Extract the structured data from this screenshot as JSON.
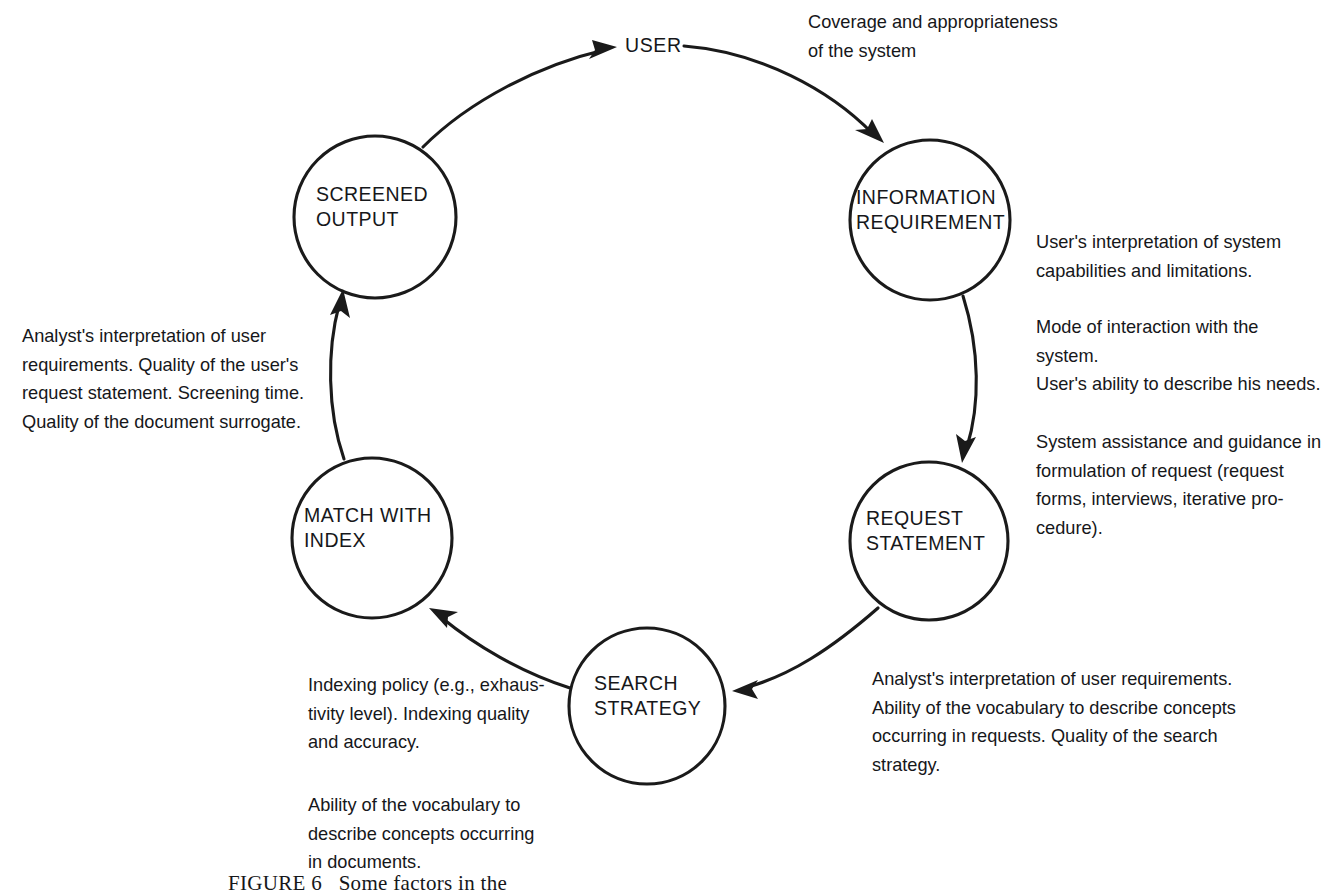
{
  "figure": {
    "caption": "FIGURE 6   Some factors in the"
  },
  "nodes": [
    {
      "id": "user",
      "label": "USER",
      "shape": "text"
    },
    {
      "id": "information",
      "label": "INFORMATION\nREQUIREMENT",
      "shape": "circle"
    },
    {
      "id": "request",
      "label": "REQUEST\nSTATEMENT",
      "shape": "circle"
    },
    {
      "id": "search",
      "label": "SEARCH\nSTRATEGY",
      "shape": "circle"
    },
    {
      "id": "match",
      "label": "MATCH WITH\nINDEX",
      "shape": "circle"
    },
    {
      "id": "screened",
      "label": "SCREENED\nOUTPUT",
      "shape": "circle"
    }
  ],
  "annotations": [
    {
      "id": "coverage",
      "text": "Coverage and appropriateness\nof the system"
    },
    {
      "id": "user-interpretation",
      "text": "User's interpretation of system\ncapabilities and limitations."
    },
    {
      "id": "mode-of-interaction",
      "text": "Mode of interaction with the\nsystem."
    },
    {
      "id": "user-ability",
      "text": "User's ability to describe his needs."
    },
    {
      "id": "system-assistance",
      "text": "System assistance and guidance in\nformulation of request (request\nforms, interviews, iterative pro-\ncedure)."
    },
    {
      "id": "analyst-interpretation-request",
      "text": "Analyst's interpretation of user requirements.\nAbility of the vocabulary to describe concepts\noccurring in requests. Quality of the search\nstrategy."
    },
    {
      "id": "indexing-policy",
      "text": "Indexing policy (e.g., exhaus-\ntivity level). Indexing quality\nand accuracy."
    },
    {
      "id": "vocabulary-documents",
      "text": "Ability of the vocabulary to\ndescribe concepts occurring\nin documents."
    },
    {
      "id": "analyst-interpretation-output",
      "text": "Analyst's interpretation of user\nrequirements. Quality of the user's\nrequest statement. Screening time.\nQuality of the document surrogate."
    }
  ],
  "flow": {
    "edges": [
      {
        "id": "screened-to-user",
        "from": "SCREENED OUTPUT",
        "to": "USER"
      },
      {
        "id": "user-to-information",
        "from": "USER",
        "to": "INFORMATION REQUIREMENT"
      },
      {
        "id": "information-to-request",
        "from": "INFORMATION REQUIREMENT",
        "to": "REQUEST STATEMENT"
      },
      {
        "id": "request-to-search",
        "from": "REQUEST STATEMENT",
        "to": "SEARCH STRATEGY"
      },
      {
        "id": "search-to-match",
        "from": "SEARCH STRATEGY",
        "to": "MATCH WITH INDEX"
      },
      {
        "id": "match-to-screened",
        "from": "MATCH WITH INDEX",
        "to": "SCREENED OUTPUT"
      }
    ]
  },
  "colors": {
    "background": "#ffffff",
    "ink": "#1a1a1a",
    "text": "#16171a"
  }
}
